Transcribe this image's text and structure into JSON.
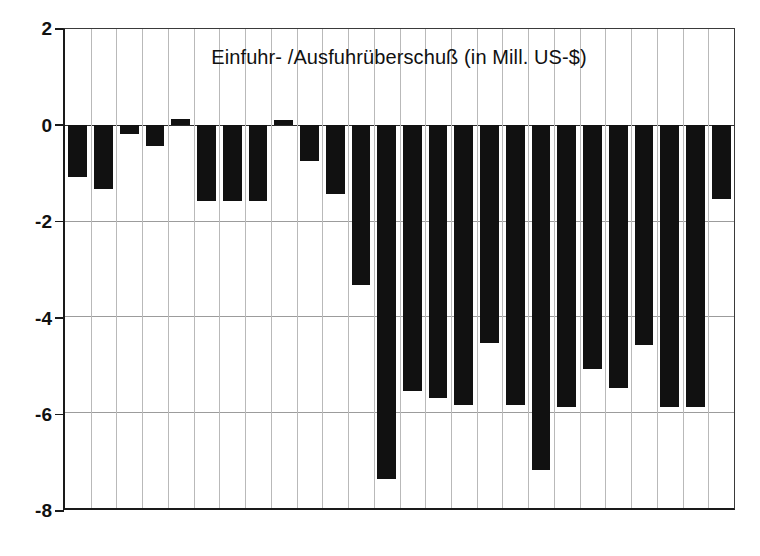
{
  "chart_data": {
    "type": "bar",
    "title": "Einfuhr- /Ausfuhrüberschuß (in Mill. US-$)",
    "subtitle": "",
    "xlabel": "",
    "ylabel": "",
    "ylim": [
      -8,
      2
    ],
    "yticks": [
      2,
      0,
      -2,
      -4,
      -6,
      -8
    ],
    "ytick_labels": [
      "2",
      "0",
      "-2",
      "-4",
      "-6",
      "-8"
    ],
    "grid": true,
    "grid_axis": "both",
    "legend": false,
    "legend_position": "none",
    "bar_color": "#111111",
    "categories": [
      "1",
      "2",
      "3",
      "4",
      "5",
      "6",
      "7",
      "8",
      "9",
      "10",
      "11",
      "12",
      "13",
      "14",
      "15",
      "16",
      "17",
      "18",
      "19",
      "20",
      "21",
      "22",
      "23",
      "24",
      "25",
      "26"
    ],
    "values": [
      -1.1,
      -1.35,
      -0.2,
      -0.45,
      0.12,
      -1.6,
      -1.6,
      -1.6,
      0.1,
      -0.75,
      -1.45,
      -3.35,
      -7.4,
      -5.55,
      -5.7,
      -5.85,
      -4.55,
      -5.85,
      -7.2,
      -5.9,
      -5.1,
      -5.5,
      -4.6,
      -5.9,
      -5.9,
      -1.55
    ]
  },
  "axis": {
    "y_label_top": "2",
    "y_label_zero": "0",
    "y_label_n2": "-2",
    "y_label_n4": "-4",
    "y_label_n6": "-6",
    "y_label_n8": "-8"
  }
}
